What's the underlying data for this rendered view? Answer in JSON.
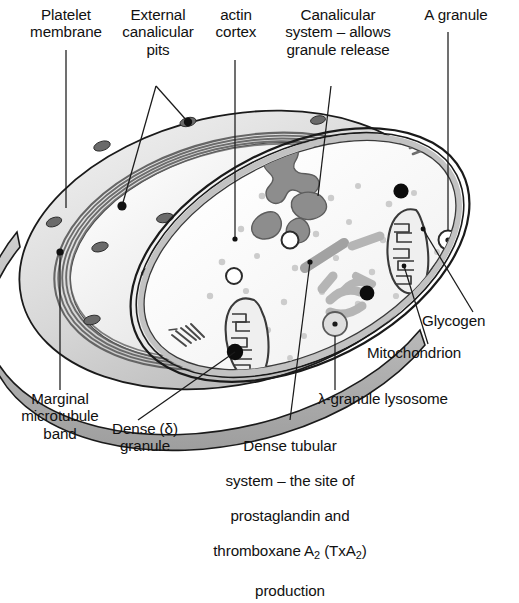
{
  "figure": {
    "labels": {
      "platelet_membrane": "Platelet\nmembrane",
      "external_canalicular_pits": "External\ncanalicular\npits",
      "actin_cortex": "actin\ncortex",
      "canalicular_system": "Canalicular\nsystem – allows\ngranule release",
      "a_granule": "A granule",
      "glycogen": "Glycogen",
      "mitochondrion": "Mitochondrion",
      "lambda_granule_lysosome": "λ-granule lysosome",
      "marginal_microtubule_band": "Marginal\nmicrotubule\nband",
      "dense_granule": "Dense (δ)\ngranule",
      "dense_tubular_system_line1": "Dense tubular",
      "dense_tubular_system_line2": "system – the site of",
      "dense_tubular_system_line3": "prostaglandin and",
      "dense_tubular_system_line4_a": "thromboxane A",
      "dense_tubular_system_line4_sub1": "2",
      "dense_tubular_system_line4_b": " (TxA",
      "dense_tubular_system_line4_sub2": "2",
      "dense_tubular_system_line4_c": ")",
      "dense_tubular_system_line5": "production"
    },
    "colors": {
      "outline": "#1a1a1a",
      "membrane_rim": "#2b2b2b",
      "cut_surface_light": "#e6e6e6",
      "cut_surface_dark": "#b9b9b9",
      "cytoplasm": "#fbfbfb",
      "organelle_gray": "#8d8d8d",
      "organelle_fill": "#eeeeee",
      "glycogen_dot": "#c9c9c9",
      "dense_granule": "#0c0c0c",
      "lysosome_fill": "#dcdcdc",
      "microtubule_band": "#6e6e6e",
      "leader_line": "#1a1a1a",
      "background": "#ffffff"
    },
    "structures": {
      "mitochondria_count": 2,
      "a_granules_count": 3,
      "dense_granules_count": 4,
      "glycogen_dots_count": 34,
      "external_pits_count": 11,
      "dense_tubules_count": 7,
      "lysosomes_count": 2
    }
  }
}
